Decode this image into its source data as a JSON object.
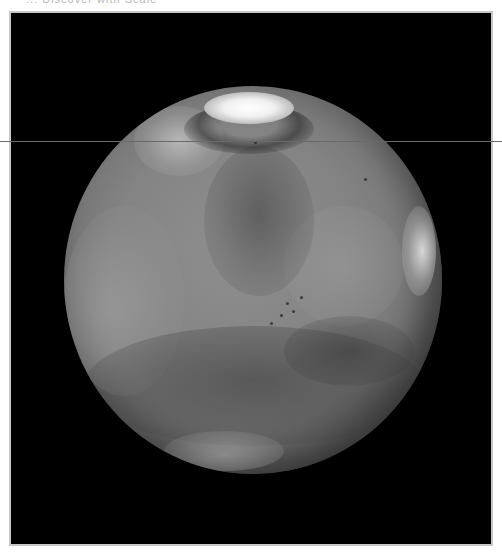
{
  "caption": {
    "text": "... Discover with Scale",
    "partially_clipped": true
  },
  "image": {
    "subject": "Mars",
    "description": "Grayscale telescopic image of the planet Mars with bright north polar ice cap, white limb clouds, and dark albedo features",
    "colors": {
      "frame_background": "#000000",
      "frame_border": "#c8c8c8",
      "page_background": "#ffffff",
      "planet_midtone": "#858585",
      "polar_cap": "#f0f0f0",
      "scanline": "#6a6a6a"
    },
    "features": [
      "north-polar-cap",
      "northwest-bright-cloud",
      "dark-northern-region",
      "eastern-limb-clouds",
      "southern-dark-band"
    ]
  }
}
